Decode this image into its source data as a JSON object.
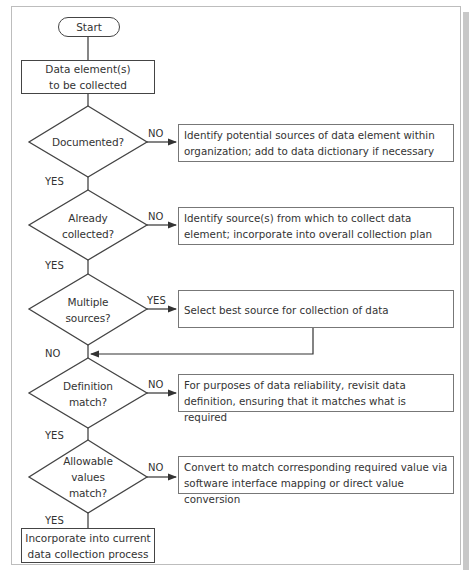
{
  "flowchart": {
    "start": {
      "label": "Start"
    },
    "input": {
      "line1": "Data element(s)",
      "line2": "to be collected"
    },
    "decisions": [
      {
        "id": "documented",
        "lines": [
          "Documented?"
        ],
        "no_label": "NO",
        "yes_label": "YES",
        "action": {
          "line1": "Identify potential sources of data element within",
          "line2": "organization; add to data dictionary if necessary"
        }
      },
      {
        "id": "already-collected",
        "lines": [
          "Already",
          "collected?"
        ],
        "no_label": "NO",
        "yes_label": "YES",
        "action": {
          "line1": "Identify source(s) from which to collect data",
          "line2": "element; incorporate into overall collection plan"
        }
      },
      {
        "id": "multiple-sources",
        "lines": [
          "Multiple",
          "sources?"
        ],
        "yes_label": "YES",
        "no_label": "NO",
        "action": {
          "line1": "Select best source for collection of data",
          "line2": ""
        }
      },
      {
        "id": "definition-match",
        "lines": [
          "Definition",
          "match?"
        ],
        "no_label": "NO",
        "yes_label": "YES",
        "action": {
          "line1": "For purposes of data reliability, revisit data",
          "line2": "definition, ensuring that it matches what is required"
        }
      },
      {
        "id": "allowable-values",
        "lines": [
          "Allowable",
          "values",
          "match?"
        ],
        "no_label": "NO",
        "yes_label": "YES",
        "action": {
          "line1": "Convert to match corresponding required value via",
          "line2": "software interface mapping or direct value conversion"
        }
      }
    ],
    "end": {
      "line1": "Incorporate into current",
      "line2": "data collection process"
    }
  }
}
